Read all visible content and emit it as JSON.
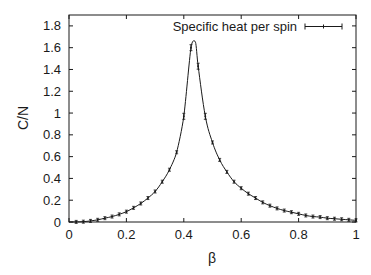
{
  "chart_data": {
    "type": "line",
    "title": "",
    "xlabel": "β",
    "ylabel": "C/N",
    "xlim": [
      0,
      1
    ],
    "ylim": [
      0,
      1.9
    ],
    "grid": false,
    "legend": {
      "position": "top-right",
      "entries": [
        "Specific heat per spin"
      ]
    },
    "x_ticks": [
      0,
      0.2,
      0.4,
      0.6,
      0.8,
      1
    ],
    "x_tick_labels": [
      "0",
      "0.2",
      "0.4",
      "0.6",
      "0.8",
      "1"
    ],
    "y_ticks": [
      0,
      0.2,
      0.4,
      0.6,
      0.8,
      1,
      1.2,
      1.4,
      1.6,
      1.8
    ],
    "y_tick_labels": [
      "0",
      "0.2",
      "0.4",
      "0.6",
      "0.8",
      "1",
      "1.2",
      "1.4",
      "1.6",
      "1.8"
    ],
    "series": [
      {
        "name": "Specific heat per spin",
        "style": "line with error bars",
        "color": "#1a1a1a",
        "x": [
          0.025,
          0.05,
          0.075,
          0.1,
          0.125,
          0.15,
          0.175,
          0.2,
          0.225,
          0.25,
          0.275,
          0.3,
          0.325,
          0.35,
          0.375,
          0.4,
          0.425,
          0.45,
          0.475,
          0.5,
          0.525,
          0.55,
          0.575,
          0.6,
          0.625,
          0.65,
          0.675,
          0.7,
          0.725,
          0.75,
          0.775,
          0.8,
          0.825,
          0.85,
          0.875,
          0.9,
          0.925,
          0.95,
          0.975,
          1.0
        ],
        "y": [
          0.001,
          0.003,
          0.01,
          0.02,
          0.035,
          0.05,
          0.07,
          0.095,
          0.13,
          0.17,
          0.22,
          0.28,
          0.37,
          0.48,
          0.64,
          0.97,
          1.6,
          1.43,
          0.97,
          0.73,
          0.57,
          0.46,
          0.37,
          0.31,
          0.26,
          0.22,
          0.18,
          0.15,
          0.125,
          0.105,
          0.09,
          0.075,
          0.06,
          0.05,
          0.045,
          0.035,
          0.03,
          0.025,
          0.02,
          0.015
        ],
        "peak": {
          "x": 0.4407,
          "y": 1.65
        }
      }
    ]
  }
}
